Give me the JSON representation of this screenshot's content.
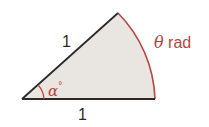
{
  "diagram": {
    "type": "circular-sector",
    "colors": {
      "fill": "#e9e5e0",
      "radius_lines": "#2b2b2b",
      "arc": "#b8443f",
      "label_accent": "#b8443f",
      "label_dark": "#2b2b2b"
    },
    "labels": {
      "top_radius": "1",
      "bottom_radius": "1",
      "angle_symbol": "α",
      "angle_unit": "°",
      "arc_symbol": "θ",
      "arc_unit": "rad"
    }
  }
}
